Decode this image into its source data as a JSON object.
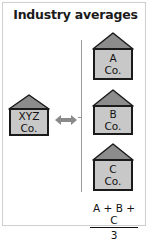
{
  "title": "Industry averages",
  "colors": {
    "roof": "#8c8c8c",
    "body": "#c8c8c8",
    "outline": "#1a1a1a",
    "frame": "#cfcfcf",
    "connector": "#9a9a9a",
    "arrow": "#8a8a8a"
  },
  "subject_company": {
    "line1": "XYZ",
    "line2": "Co."
  },
  "industry_companies": [
    {
      "line1": "A",
      "line2": "Co."
    },
    {
      "line1": "B",
      "line2": "Co."
    },
    {
      "line1": "C",
      "line2": "Co."
    }
  ],
  "comparison_arrow": "double-headed-arrow",
  "formula": {
    "numerator": "A + B + C",
    "denominator": "3"
  }
}
